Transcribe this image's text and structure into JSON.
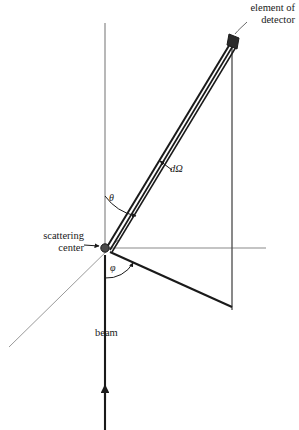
{
  "figure": {
    "background_color": "#ffffff",
    "ink_color": "#1a1a1a",
    "thin_line_color": "#8a8a8a",
    "width": 299,
    "height": 430
  },
  "labels": {
    "element_of_detector": "element of\ndetector",
    "scattering_center": "scattering\ncenter",
    "beam": "beam",
    "solid_angle": "dΩ",
    "theta": "θ",
    "phi": "φ"
  },
  "geometry": {
    "scattering_center": {
      "x": 105,
      "y": 248
    },
    "detector_element": {
      "x": 234,
      "y": 40
    },
    "vertical_axis": {
      "x": 105,
      "y_top": 23,
      "y_bottom": 430
    },
    "horizontal_axis": {
      "y": 248,
      "x_start": 105,
      "x_end": 266
    },
    "detector_plane_vertical": {
      "x": 232,
      "y_top": 38,
      "y_bottom": 310
    },
    "beam_arrow_tip": {
      "x": 105,
      "y": 390
    },
    "lower_ray_end": {
      "x": 232,
      "y": 307
    },
    "thin_diagonal_end": {
      "x": 9,
      "y": 347
    },
    "theta_arc_radius": 52,
    "phi_arc_radius": 30
  }
}
